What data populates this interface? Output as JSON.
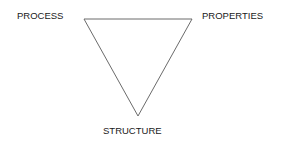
{
  "diagram": {
    "type": "triangle",
    "vertices": {
      "top_left": "PROCESS",
      "top_right": "PROPERTIES",
      "bottom": "STRUCTURE"
    },
    "labels": {
      "process": "PROCESS",
      "properties": "PROPERTIES",
      "structure": "STRUCTURE"
    },
    "edges": [
      {
        "from": "PROCESS",
        "to": "PROPERTIES"
      },
      {
        "from": "PROPERTIES",
        "to": "STRUCTURE"
      },
      {
        "from": "STRUCTURE",
        "to": "PROCESS"
      }
    ],
    "line_color": "#6b6b6b",
    "text_color": "#1a1a1a"
  }
}
